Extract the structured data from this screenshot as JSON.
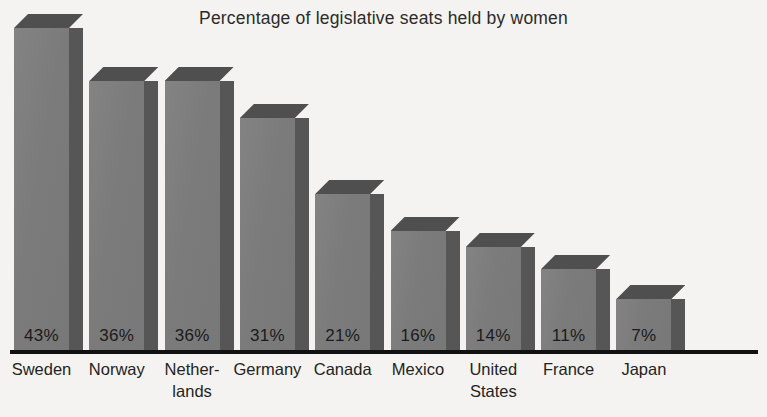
{
  "chart_data": {
    "type": "bar",
    "title": "Percentage of legislative seats held by women",
    "xlabel": "",
    "ylabel": "",
    "ylim": [
      0,
      47
    ],
    "grid": false,
    "legend": "none",
    "value_suffix": "%",
    "categories": [
      "Sweden",
      "Norway",
      "Netherlands",
      "Germany",
      "Canada",
      "Mexico",
      "United States",
      "France",
      "Japan"
    ],
    "category_display": [
      "Sweden",
      "Norway",
      "Nether-\nlands",
      "Germany",
      "Canada",
      "Mexico",
      "United\nStates",
      "France",
      "Japan"
    ],
    "values": [
      43,
      36,
      36,
      31,
      21,
      16,
      14,
      11,
      7
    ],
    "value_labels": [
      "43%",
      "36%",
      "36%",
      "31%",
      "21%",
      "16%",
      "14%",
      "11%",
      "7%"
    ]
  },
  "style": {
    "background": "#f4f3f1",
    "bar_front": "#7d7d7d",
    "bar_side": "#565656",
    "bar_top": "#4f4f4f",
    "axis_color": "#111111",
    "text_color": "#232323"
  }
}
